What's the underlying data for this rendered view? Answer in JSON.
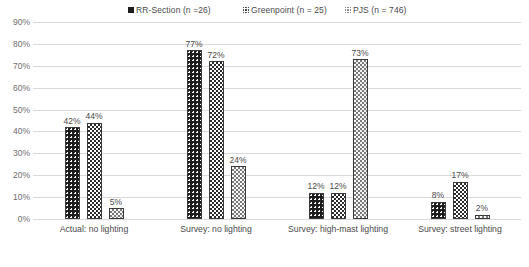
{
  "chart_data": {
    "type": "bar",
    "title": "",
    "xlabel": "",
    "ylabel": "",
    "ylim": [
      0,
      90
    ],
    "grid": true,
    "legend_position": "top",
    "categories": [
      "Actual: no lighting",
      "Survey: no lighting",
      "Survey: high-mast lighting",
      "Survey: street lighting"
    ],
    "ytick_labels": [
      "90%",
      "80%",
      "70%",
      "60%",
      "50%",
      "40%",
      "30%",
      "20%",
      "10%",
      "0%"
    ],
    "ytick_values": [
      90,
      80,
      70,
      60,
      50,
      40,
      30,
      20,
      10,
      0
    ],
    "series": [
      {
        "name": "RR-Section (n =26)",
        "pattern": "dark-dotted",
        "color": "#1d1d1d",
        "values": [
          42,
          77,
          12,
          8
        ],
        "labels": [
          "42%",
          "77%",
          "12%",
          "8%"
        ]
      },
      {
        "name": "Greenpoint (n = 25)",
        "pattern": "checker-dotted",
        "color": "#2b2b2b",
        "values": [
          44,
          72,
          12,
          17
        ],
        "labels": [
          "44%",
          "72%",
          "12%",
          "17%"
        ]
      },
      {
        "name": "PJS (n = 746)",
        "pattern": "gray-dotted",
        "color": "#7a7a7a",
        "values": [
          5,
          24,
          73,
          2
        ],
        "labels": [
          "5%",
          "24%",
          "73%",
          "2%"
        ]
      }
    ]
  },
  "legend": {
    "items": [
      {
        "label": "RR-Section (n =26)",
        "swatch": "dark-dotted-swatch"
      },
      {
        "label": "Greenpoint (n = 25)",
        "swatch": "checker-dotted-swatch"
      },
      {
        "label": "PJS (n = 746)",
        "swatch": "gray-dotted-swatch"
      }
    ]
  }
}
